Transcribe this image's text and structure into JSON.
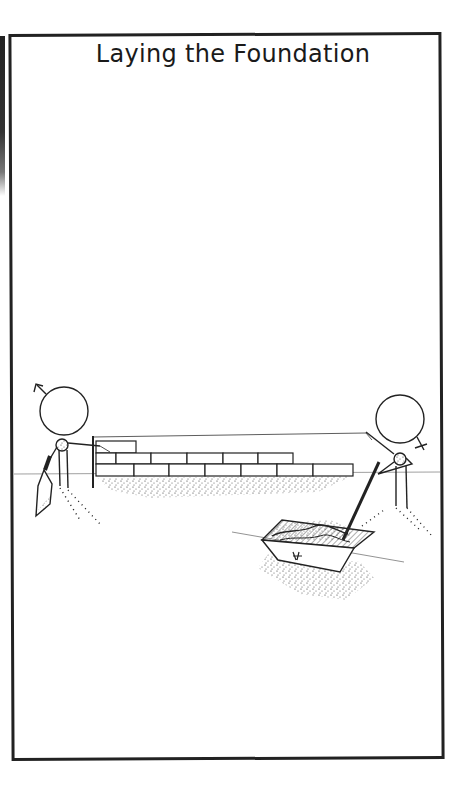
{
  "page": {
    "title": "Laying the Foundation"
  },
  "scene": {
    "description": "Cartoon illustration: a stick figure with a male symbol on the left laying a brick wall using a string line; a stick figure with a female symbol on the right mixing mortar in a tray with a hoe.",
    "figures": [
      {
        "position": "left",
        "symbol": "male",
        "symbol_glyph": "♂",
        "action": "holding trowel, laying bricks"
      },
      {
        "position": "right",
        "symbol": "female",
        "symbol_glyph": "♀",
        "action": "mixing mortar with hoe"
      }
    ],
    "wall": {
      "courses": 3,
      "top_course_bricks": 1,
      "middle_course_bricks": 6,
      "bottom_course_bricks": 7
    },
    "colors": {
      "ink": "#1a1a1a",
      "paper": "#ffffff",
      "ground_line": "#888888"
    }
  }
}
